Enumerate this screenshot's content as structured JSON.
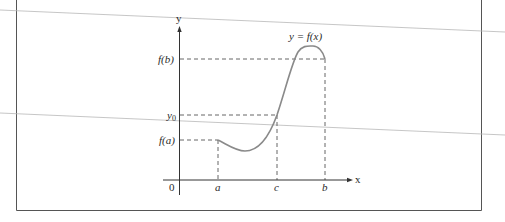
{
  "figure": {
    "type": "intermediate-value-theorem-graph",
    "curve_label": "y = f(x)",
    "axes": {
      "x_label": "x",
      "y_label": "y",
      "origin_label": "0"
    },
    "x_ticks": [
      {
        "label": "a",
        "x": 218
      },
      {
        "label": "c",
        "x": 277
      },
      {
        "label": "b",
        "x": 325
      }
    ],
    "y_ticks": [
      {
        "label": "f(b)",
        "y": 59
      },
      {
        "label": "y0",
        "y": 115
      },
      {
        "label": "f(a)",
        "y": 140
      }
    ],
    "labels": {
      "fb": "f(b)",
      "y0_base": "y",
      "y0_sub": "0",
      "fa": "f(a)",
      "a": "a",
      "c": "c",
      "b": "b",
      "x": "x",
      "y": "y",
      "origin": "0",
      "curve": "y = f(x)"
    },
    "colors": {
      "curve": "#8a8a8a",
      "axis": "#333333",
      "dashed": "#555555",
      "frame": "#555555",
      "scan_line": "#b0b0b0"
    }
  }
}
